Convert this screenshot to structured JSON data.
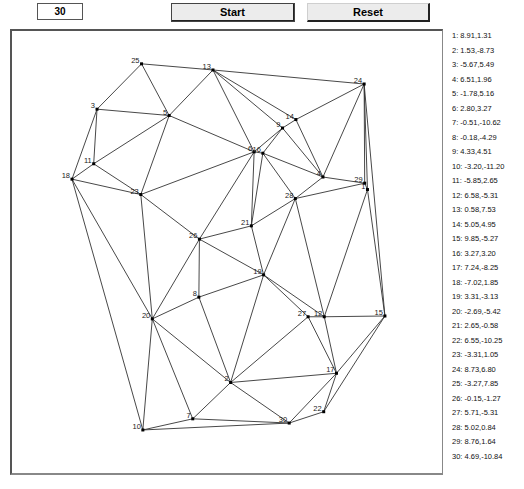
{
  "controls": {
    "point_count": "30",
    "start_label": "Start",
    "reset_label": "Reset"
  },
  "points": [
    {
      "id": 1,
      "label": "1: 8.91,1.31",
      "x": 8.91,
      "y": 1.31
    },
    {
      "id": 2,
      "label": "2: 1.53,-8.73",
      "x": 1.53,
      "y": -8.73
    },
    {
      "id": 3,
      "label": "3: -5.67,5.49",
      "x": -5.67,
      "y": 5.49
    },
    {
      "id": 4,
      "label": "4: 6.51,1.96",
      "x": 6.51,
      "y": 1.96
    },
    {
      "id": 5,
      "label": "5: -1.78,5.16",
      "x": -1.78,
      "y": 5.16
    },
    {
      "id": 6,
      "label": "6: 2.80,3.27",
      "x": 2.8,
      "y": 3.27
    },
    {
      "id": 7,
      "label": "7: -0.51,-10.62",
      "x": -0.51,
      "y": -10.62
    },
    {
      "id": 8,
      "label": "8: -0.18,-4.29",
      "x": -0.18,
      "y": -4.29
    },
    {
      "id": 9,
      "label": "9: 4.33,4.51",
      "x": 4.33,
      "y": 4.51
    },
    {
      "id": 10,
      "label": "10: -3.20,-11.20",
      "x": -3.2,
      "y": -11.2
    },
    {
      "id": 11,
      "label": "11: -5.85,2.65",
      "x": -5.85,
      "y": 2.65
    },
    {
      "id": 12,
      "label": "12: 6.58,-5.31",
      "x": 6.58,
      "y": -5.31
    },
    {
      "id": 13,
      "label": "13: 0.58,7.53",
      "x": 0.58,
      "y": 7.53
    },
    {
      "id": 14,
      "label": "14: 5.05,4.95",
      "x": 5.05,
      "y": 4.95
    },
    {
      "id": 15,
      "label": "15: 9.85,-5.27",
      "x": 9.85,
      "y": -5.27
    },
    {
      "id": 16,
      "label": "16: 3.27,3.20",
      "x": 3.27,
      "y": 3.2
    },
    {
      "id": 17,
      "label": "17: 7.24,-8.25",
      "x": 7.24,
      "y": -8.25
    },
    {
      "id": 18,
      "label": "18: -7.02,1.85",
      "x": -7.02,
      "y": 1.85
    },
    {
      "id": 19,
      "label": "19: 3.31,-3.13",
      "x": 3.31,
      "y": -3.13
    },
    {
      "id": 20,
      "label": "20: -2.69,-5.42",
      "x": -2.69,
      "y": -5.42
    },
    {
      "id": 21,
      "label": "21: 2.65,-0.58",
      "x": 2.65,
      "y": -0.58
    },
    {
      "id": 22,
      "label": "22: 6.55,-10.25",
      "x": 6.55,
      "y": -10.25
    },
    {
      "id": 23,
      "label": "23: -3.31,1.05",
      "x": -3.31,
      "y": 1.05
    },
    {
      "id": 24,
      "label": "24: 8.73,6.80",
      "x": 8.73,
      "y": 6.8
    },
    {
      "id": 25,
      "label": "25: -3.27,7.85",
      "x": -3.27,
      "y": 7.85
    },
    {
      "id": 26,
      "label": "26: -0.15,-1.27",
      "x": -0.15,
      "y": -1.27
    },
    {
      "id": 27,
      "label": "27: 5.71,-5.31",
      "x": 5.71,
      "y": -5.31
    },
    {
      "id": 28,
      "label": "28: 5.02,0.84",
      "x": 5.02,
      "y": 0.84
    },
    {
      "id": 29,
      "label": "29: 8.76,1.64",
      "x": 8.76,
      "y": 1.64
    },
    {
      "id": 30,
      "label": "30: 4.69,-10.84",
      "x": 4.69,
      "y": -10.84
    }
  ],
  "edges": [
    [
      25,
      13
    ],
    [
      25,
      5
    ],
    [
      25,
      3
    ],
    [
      13,
      5
    ],
    [
      13,
      6
    ],
    [
      13,
      9
    ],
    [
      13,
      14
    ],
    [
      13,
      24
    ],
    [
      3,
      5
    ],
    [
      3,
      11
    ],
    [
      3,
      18
    ],
    [
      5,
      11
    ],
    [
      5,
      23
    ],
    [
      5,
      6
    ],
    [
      11,
      18
    ],
    [
      11,
      23
    ],
    [
      18,
      23
    ],
    [
      18,
      20
    ],
    [
      18,
      10
    ],
    [
      23,
      6
    ],
    [
      23,
      26
    ],
    [
      23,
      20
    ],
    [
      6,
      9
    ],
    [
      6,
      16
    ],
    [
      6,
      26
    ],
    [
      6,
      21
    ],
    [
      9,
      16
    ],
    [
      9,
      14
    ],
    [
      9,
      4
    ],
    [
      14,
      24
    ],
    [
      14,
      4
    ],
    [
      24,
      4
    ],
    [
      24,
      29
    ],
    [
      24,
      1
    ],
    [
      24,
      15
    ],
    [
      16,
      4
    ],
    [
      16,
      28
    ],
    [
      16,
      21
    ],
    [
      4,
      29
    ],
    [
      4,
      28
    ],
    [
      29,
      1
    ],
    [
      29,
      28
    ],
    [
      1,
      15
    ],
    [
      1,
      12
    ],
    [
      28,
      12
    ],
    [
      28,
      19
    ],
    [
      28,
      21
    ],
    [
      21,
      26
    ],
    [
      21,
      19
    ],
    [
      26,
      19
    ],
    [
      26,
      8
    ],
    [
      26,
      20
    ],
    [
      8,
      20
    ],
    [
      8,
      19
    ],
    [
      8,
      2
    ],
    [
      19,
      2
    ],
    [
      19,
      27
    ],
    [
      19,
      12
    ],
    [
      27,
      12
    ],
    [
      27,
      2
    ],
    [
      27,
      17
    ],
    [
      12,
      17
    ],
    [
      12,
      15
    ],
    [
      15,
      17
    ],
    [
      15,
      22
    ],
    [
      17,
      22
    ],
    [
      17,
      2
    ],
    [
      17,
      30
    ],
    [
      22,
      30
    ],
    [
      2,
      30
    ],
    [
      2,
      7
    ],
    [
      2,
      20
    ],
    [
      20,
      7
    ],
    [
      20,
      10
    ],
    [
      7,
      10
    ],
    [
      7,
      30
    ],
    [
      10,
      30
    ]
  ],
  "plot_mapping": {
    "x0": 202.2,
    "sx": 18.55,
    "y0": 214.7,
    "sy": 19.22
  }
}
